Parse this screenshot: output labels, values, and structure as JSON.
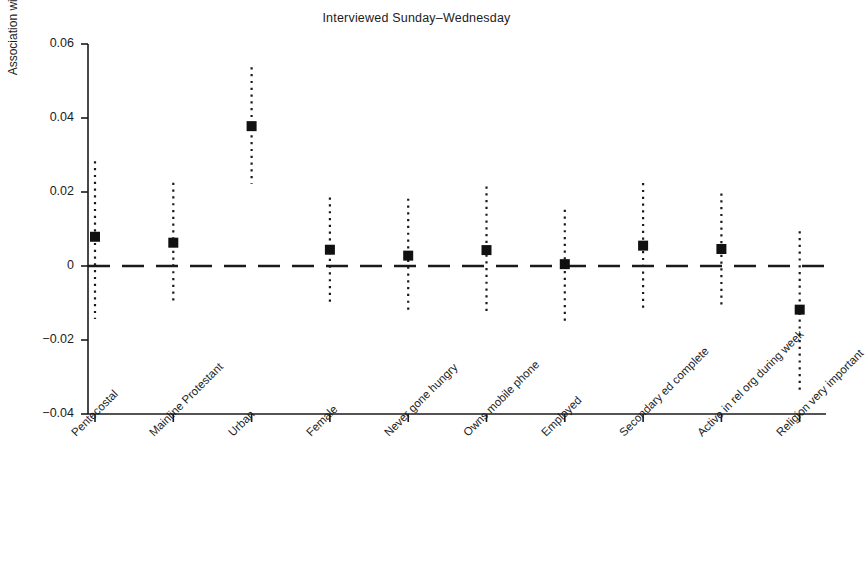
{
  "chart_data": {
    "type": "scatter",
    "title": "Interviewed Sunday–Wednesday",
    "xlabel": "",
    "ylabel": "Association with being interviewed Sunday–Wednesday",
    "ylim": [
      -0.048,
      0.068
    ],
    "yticks": [
      0.06,
      0.04,
      0.02,
      0,
      -0.02,
      -0.04
    ],
    "ytick_labels": [
      "0.06",
      "0.04",
      "0.02",
      "0",
      "−0.02",
      "−0.04"
    ],
    "grid": false,
    "legend": null,
    "reference_line": {
      "y": 0,
      "style": "dashed"
    },
    "marker": "filled-square",
    "errorbar_style": "dotted",
    "categories": [
      "Pentecostal",
      "Mainline Protestant",
      "Urban",
      "Female",
      "Never gone hungry",
      "Owns mobile phone",
      "Employed",
      "Secondary ed complete",
      "Active in rel org during week",
      "Religion very important"
    ],
    "values": [
      0.0079,
      0.0063,
      0.0378,
      0.0044,
      0.0028,
      0.0043,
      0.0005,
      0.0055,
      0.0046,
      -0.0118
    ],
    "ci_lower": [
      -0.0143,
      -0.0099,
      0.0222,
      -0.0109,
      -0.0118,
      -0.013,
      -0.015,
      -0.0124,
      -0.0104,
      -0.0338
    ],
    "ci_upper": [
      0.0283,
      0.0225,
      0.0537,
      0.0185,
      0.0182,
      0.0215,
      0.0152,
      0.0224,
      0.0196,
      0.0094
    ]
  }
}
